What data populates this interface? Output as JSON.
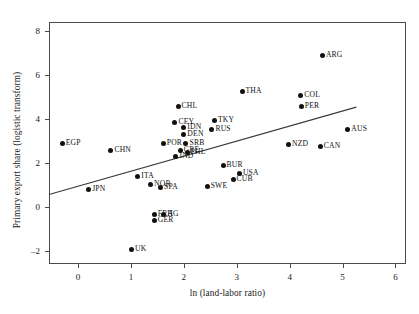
{
  "chart_data": {
    "type": "scatter",
    "title": "",
    "xlabel": "ln (land-labor ratio)",
    "ylabel": "Primary export share (logistic transform)",
    "xlim": [
      -0.55,
      6.2
    ],
    "ylim": [
      -2.6,
      8.4
    ],
    "xticks": [
      "0",
      "1",
      "2",
      "3",
      "4",
      "5",
      "6"
    ],
    "xtick_values": [
      0,
      1,
      2,
      3,
      4,
      5,
      6
    ],
    "yticks": [
      "-2",
      "0",
      "2",
      "4",
      "6",
      "8"
    ],
    "ytick_values": [
      -2,
      0,
      2,
      4,
      6,
      8
    ],
    "grid": false,
    "legend": "none",
    "points": [
      {
        "label": "EGP",
        "x": -0.3,
        "y": 2.9,
        "lx": 6,
        "ly": -4
      },
      {
        "label": "CHN",
        "x": 0.62,
        "y": 2.56,
        "lx": 6,
        "ly": -4
      },
      {
        "label": "JPN",
        "x": 0.2,
        "y": 0.78,
        "lx": 6,
        "ly": -4
      },
      {
        "label": "ITA",
        "x": 1.13,
        "y": 1.38,
        "lx": 6,
        "ly": -4
      },
      {
        "label": "NOR",
        "x": 1.37,
        "y": 1.03,
        "lx": 6,
        "ly": -4
      },
      {
        "label": "SPA",
        "x": 1.56,
        "y": 0.86,
        "lx": 6,
        "ly": -4
      },
      {
        "label": "UK",
        "x": 1.01,
        "y": -1.93,
        "lx": 6,
        "ly": -4
      },
      {
        "label": "FRA",
        "x": 1.44,
        "y": -0.35,
        "lx": 6,
        "ly": -4
      },
      {
        "label": "HG",
        "x": 1.62,
        "y": -0.37,
        "lx": 6,
        "ly": -4
      },
      {
        "label": "GER",
        "x": 1.44,
        "y": -0.62,
        "lx": 6,
        "ly": -4
      },
      {
        "label": "POR",
        "x": 1.61,
        "y": 2.9,
        "lx": 6,
        "ly": -4
      },
      {
        "label": "CEY",
        "x": 1.83,
        "y": 3.82,
        "lx": 6,
        "ly": -4
      },
      {
        "label": "CHL",
        "x": 1.89,
        "y": 4.56,
        "lx": 6,
        "ly": -4
      },
      {
        "label": "IDN",
        "x": 2.0,
        "y": 3.59,
        "lx": 6,
        "ly": -4
      },
      {
        "label": "DEN",
        "x": 2.0,
        "y": 3.3,
        "lx": 6,
        "ly": -4
      },
      {
        "label": "SRB",
        "x": 2.04,
        "y": 2.86,
        "lx": 6,
        "ly": -4
      },
      {
        "label": "GRE",
        "x": 1.93,
        "y": 2.55,
        "lx": 6,
        "ly": -4
      },
      {
        "label": "PHL",
        "x": 2.06,
        "y": 2.49,
        "lx": 6,
        "ly": -4
      },
      {
        "label": "IND",
        "x": 1.85,
        "y": 2.3,
        "lx": 6,
        "ly": -4
      },
      {
        "label": "TKY",
        "x": 2.58,
        "y": 3.93,
        "lx": 6,
        "ly": -4
      },
      {
        "label": "RUS",
        "x": 2.53,
        "y": 3.51,
        "lx": 6,
        "ly": -4
      },
      {
        "label": "THA",
        "x": 3.1,
        "y": 5.22,
        "lx": 6,
        "ly": -4
      },
      {
        "label": "SWE",
        "x": 2.44,
        "y": 0.92,
        "lx": 6,
        "ly": -4
      },
      {
        "label": "BUR",
        "x": 2.74,
        "y": 1.86,
        "lx": 6,
        "ly": -4
      },
      {
        "label": "USA",
        "x": 3.05,
        "y": 1.53,
        "lx": 6,
        "ly": -4
      },
      {
        "label": "CUB",
        "x": 2.93,
        "y": 1.24,
        "lx": 6,
        "ly": -4
      },
      {
        "label": "COL",
        "x": 4.21,
        "y": 5.07,
        "lx": 6,
        "ly": -4
      },
      {
        "label": "PER",
        "x": 4.22,
        "y": 4.57,
        "lx": 6,
        "ly": -4
      },
      {
        "label": "ARG",
        "x": 4.62,
        "y": 6.9,
        "lx": 6,
        "ly": -4
      },
      {
        "label": "AUS",
        "x": 5.1,
        "y": 3.51,
        "lx": 6,
        "ly": -4
      },
      {
        "label": "NZD",
        "x": 3.98,
        "y": 2.83,
        "lx": 6,
        "ly": -4
      },
      {
        "label": "CAN",
        "x": 4.58,
        "y": 2.75,
        "lx": 6,
        "ly": -4
      }
    ],
    "fit_line": {
      "kind": "linear-regression",
      "x_start": -0.55,
      "y_start": 0.56,
      "x_end": 5.26,
      "y_end": 4.53
    }
  }
}
